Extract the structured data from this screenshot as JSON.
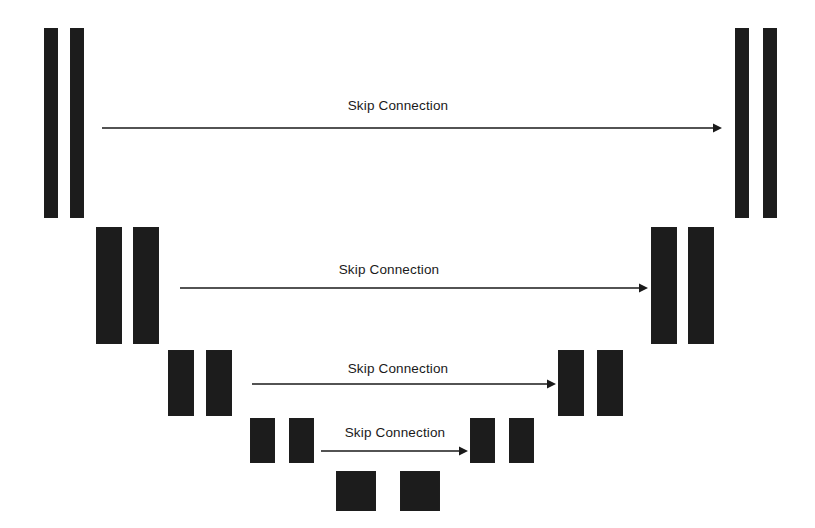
{
  "diagram": {
    "background_color": "#ffffff",
    "block_color": "#1c1c1c",
    "arrow_color": "#1a1a1a",
    "width": 815,
    "height": 528,
    "levels": [
      {
        "index": 1,
        "name": "level-1",
        "encoder_blocks": [
          {
            "name": "encoder-block-1a",
            "x": 44,
            "y": 28,
            "w": 14,
            "h": 190
          },
          {
            "name": "encoder-block-1b",
            "x": 70,
            "y": 28,
            "w": 14,
            "h": 190
          }
        ],
        "decoder_blocks": [
          {
            "name": "decoder-block-1a",
            "x": 735,
            "y": 28,
            "w": 14,
            "h": 190
          },
          {
            "name": "decoder-block-1b",
            "x": 763,
            "y": 28,
            "w": 14,
            "h": 190
          }
        ],
        "skip": {
          "label": "Skip Connection",
          "x1": 102,
          "x2": 722,
          "y": 128,
          "label_x": 398,
          "label_y": 98
        }
      },
      {
        "index": 2,
        "name": "level-2",
        "encoder_blocks": [
          {
            "name": "encoder-block-2a",
            "x": 96,
            "y": 227,
            "w": 26,
            "h": 117
          },
          {
            "name": "encoder-block-2b",
            "x": 133,
            "y": 227,
            "w": 26,
            "h": 117
          }
        ],
        "decoder_blocks": [
          {
            "name": "decoder-block-2a",
            "x": 651,
            "y": 227,
            "w": 26,
            "h": 117
          },
          {
            "name": "decoder-block-2b",
            "x": 688,
            "y": 227,
            "w": 26,
            "h": 117
          }
        ],
        "skip": {
          "label": "Skip Connection",
          "x1": 180,
          "x2": 648,
          "y": 288,
          "label_x": 389,
          "label_y": 262
        }
      },
      {
        "index": 3,
        "name": "level-3",
        "encoder_blocks": [
          {
            "name": "encoder-block-3a",
            "x": 168,
            "y": 350,
            "w": 26,
            "h": 66
          },
          {
            "name": "encoder-block-3b",
            "x": 206,
            "y": 350,
            "w": 26,
            "h": 66
          }
        ],
        "decoder_blocks": [
          {
            "name": "decoder-block-3a",
            "x": 558,
            "y": 350,
            "w": 26,
            "h": 66
          },
          {
            "name": "decoder-block-3b",
            "x": 597,
            "y": 350,
            "w": 26,
            "h": 66
          }
        ],
        "skip": {
          "label": "Skip Connection",
          "x1": 252,
          "x2": 556,
          "y": 384,
          "label_x": 398,
          "label_y": 361
        }
      },
      {
        "index": 4,
        "name": "level-4",
        "encoder_blocks": [
          {
            "name": "encoder-block-4a",
            "x": 250,
            "y": 418,
            "w": 25,
            "h": 45
          },
          {
            "name": "encoder-block-4b",
            "x": 289,
            "y": 418,
            "w": 25,
            "h": 45
          }
        ],
        "decoder_blocks": [
          {
            "name": "decoder-block-4a",
            "x": 470,
            "y": 418,
            "w": 25,
            "h": 45
          },
          {
            "name": "decoder-block-4b",
            "x": 509,
            "y": 418,
            "w": 25,
            "h": 45
          }
        ],
        "skip": {
          "label": "Skip Connection",
          "x1": 321,
          "x2": 468,
          "y": 451,
          "label_x": 395,
          "label_y": 425
        }
      },
      {
        "index": 5,
        "name": "level-5-bottleneck",
        "encoder_blocks": [
          {
            "name": "bottleneck-block-a",
            "x": 336,
            "y": 471,
            "w": 40,
            "h": 40
          },
          {
            "name": "bottleneck-block-b",
            "x": 400,
            "y": 471,
            "w": 40,
            "h": 40
          }
        ],
        "decoder_blocks": [],
        "skip": null
      }
    ]
  }
}
